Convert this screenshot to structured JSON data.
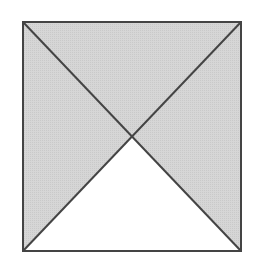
{
  "diagram": {
    "type": "square-with-diagonals",
    "square": {
      "x1": 23,
      "y1": 22,
      "x2": 241,
      "y2": 251
    },
    "center": {
      "x": 132,
      "y": 136.5
    },
    "colors": {
      "background": "#ffffff",
      "shaded_fill": "#d3d3d3",
      "unshaded_fill": "#ffffff",
      "stroke": "#444444"
    },
    "stroke_width": 2,
    "regions": [
      {
        "name": "top-triangle",
        "shaded": true
      },
      {
        "name": "left-triangle",
        "shaded": true
      },
      {
        "name": "right-triangle",
        "shaded": true
      },
      {
        "name": "bottom-triangle",
        "shaded": false
      }
    ]
  }
}
